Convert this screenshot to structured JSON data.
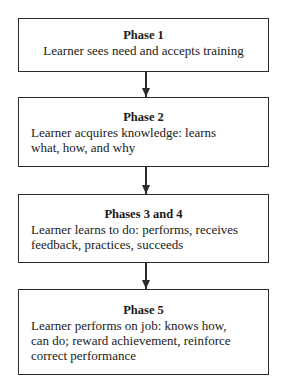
{
  "diagram": {
    "type": "flowchart",
    "direction": "top-to-bottom",
    "boxes": [
      {
        "title": "Phase 1",
        "lines": [
          "Learner sees need and accepts training"
        ]
      },
      {
        "title": "Phase 2",
        "lines": [
          "Learner acquires knowledge:  learns",
          "what, how, and why"
        ]
      },
      {
        "title": "Phases 3 and 4",
        "lines": [
          "Learner learns to do:  performs, receives",
          "feedback, practices, succeeds"
        ]
      },
      {
        "title": "Phase 5",
        "lines": [
          "Learner performs on job:  knows how,",
          "can do; reward achievement, reinforce",
          "correct performance"
        ]
      }
    ],
    "connectors": [
      {
        "from": 0,
        "to": 1,
        "icon": "arrow-down-icon"
      },
      {
        "from": 1,
        "to": 2,
        "icon": "arrow-down-icon"
      },
      {
        "from": 2,
        "to": 3,
        "icon": "arrow-down-icon"
      }
    ],
    "colors": {
      "stroke": "#2a2a2a",
      "background": "#ffffff",
      "text": "#1a1a1a"
    }
  }
}
